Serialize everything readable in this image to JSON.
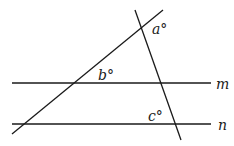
{
  "diagram": {
    "type": "parallel-lines-transversals",
    "lines": {
      "m": {
        "label": "m",
        "x1": 12,
        "y1": 83,
        "x2": 211,
        "y2": 83
      },
      "n": {
        "label": "n",
        "x1": 12,
        "y1": 124,
        "x2": 211,
        "y2": 124
      },
      "transversal_1": {
        "x1": 12,
        "y1": 134,
        "x2": 163,
        "y2": 10
      },
      "transversal_2": {
        "x1": 135,
        "y1": 10,
        "x2": 181,
        "y2": 140
      }
    },
    "angles": {
      "a": {
        "label": "a°",
        "x": 152,
        "y": 34
      },
      "b": {
        "label": "b°",
        "x": 98,
        "y": 80
      },
      "c": {
        "label": "c°",
        "x": 148,
        "y": 121
      }
    },
    "line_labels": {
      "m": {
        "text": "m",
        "x": 216,
        "y": 89
      },
      "n": {
        "text": "n",
        "x": 218,
        "y": 130
      }
    },
    "colors": {
      "stroke": "#1a1a1a",
      "background": "#ffffff"
    }
  }
}
